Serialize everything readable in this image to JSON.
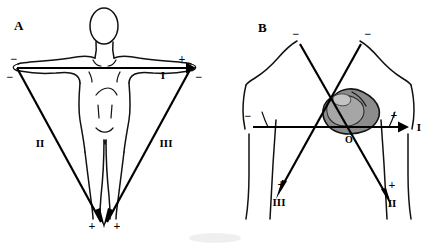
{
  "figure": {
    "background_color": "#ffffff",
    "stroke_color": "#111111",
    "heart_fill_color": "#8c8c8c",
    "width": 431,
    "height": 243
  },
  "panels": [
    {
      "id": "A",
      "letter": "A",
      "caption": "Einthoven's triangle superimposed on the body",
      "leads": [
        {
          "name": "I",
          "label": "I",
          "orientation": "horizontal",
          "negative_sign": "−",
          "positive_sign": "+"
        },
        {
          "name": "II",
          "label": "II",
          "orientation": "left-oblique",
          "negative_sign": "−",
          "positive_sign": "+"
        },
        {
          "name": "III",
          "label": "III",
          "orientation": "right-oblique",
          "negative_sign": "−",
          "positive_sign": "+"
        }
      ],
      "signs": {
        "left_shoulder_upper": "−",
        "left_shoulder_lower": "−",
        "right_shoulder_upper": "+",
        "right_shoulder_lower": "−",
        "apex_left": "+",
        "apex_right": "+"
      }
    },
    {
      "id": "B",
      "letter": "B",
      "caption": "Triaxial reference system centred on the heart",
      "origin_label": "O",
      "leads": [
        {
          "name": "I",
          "label": "I",
          "orientation": "horizontal",
          "negative_sign": "−",
          "positive_sign": "+"
        },
        {
          "name": "II",
          "label": "II",
          "orientation": "upper-left-to-lower-right",
          "negative_sign": "−",
          "positive_sign": "+"
        },
        {
          "name": "III",
          "label": "III",
          "orientation": "upper-right-to-lower-left",
          "negative_sign": "−",
          "positive_sign": "+"
        }
      ],
      "signs": {
        "lead1_negative": "−",
        "lead1_positive": "+",
        "lead2_negative": "−",
        "lead2_positive": "+",
        "lead3_negative": "−",
        "lead3_positive": "+"
      }
    }
  ]
}
